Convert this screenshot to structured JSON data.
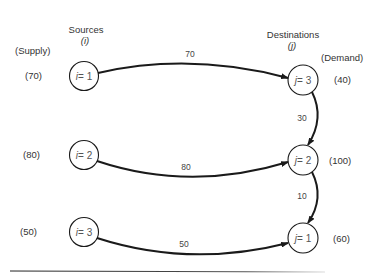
{
  "headers": {
    "sources_title": "Sources",
    "sources_index": "(i)",
    "supply_title": "(Supply)",
    "destinations_title": "Destinations",
    "destinations_index": "(j)",
    "demand_title": "(Demand)"
  },
  "sources": [
    {
      "var": "i",
      "eq": " = 1",
      "supply": "(70)"
    },
    {
      "var": "i",
      "eq": " = 2",
      "supply": "(80)"
    },
    {
      "var": "i",
      "eq": " = 3",
      "supply": "(50)"
    }
  ],
  "destinations": [
    {
      "var": "j",
      "eq": " = 3",
      "demand": "(40)"
    },
    {
      "var": "j",
      "eq": " = 2",
      "demand": "(100)"
    },
    {
      "var": "j",
      "eq": " = 1",
      "demand": "(60)"
    }
  ],
  "flows": [
    {
      "from": "i=1",
      "to": "j=3",
      "amount": "70"
    },
    {
      "from": "i=2",
      "to": "j=2",
      "amount": "80"
    },
    {
      "from": "i=3",
      "to": "j=1",
      "amount": "50"
    },
    {
      "from": "j=3",
      "to": "j=2",
      "amount": "30"
    },
    {
      "from": "j=2",
      "to": "j=1",
      "amount": "10"
    }
  ],
  "colors": {
    "line": "#1a1a1a",
    "text": "#333333"
  }
}
